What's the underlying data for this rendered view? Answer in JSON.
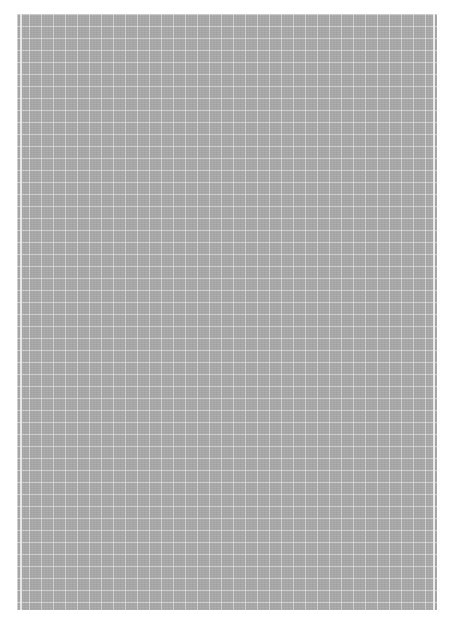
{
  "image": {
    "description": "grey grid paper sheet",
    "colors": {
      "background": "#ffffff",
      "sheet": "#a9a9a9",
      "grid_line": "#ebebeb"
    },
    "grid_spacing_px": 12
  }
}
